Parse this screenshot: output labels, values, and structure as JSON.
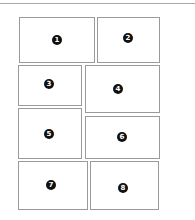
{
  "diagram": {
    "title": "",
    "panels": [
      {
        "label": "1",
        "x": 19,
        "y": 17,
        "w": 76,
        "h": 46,
        "bx": 52,
        "by": 35
      },
      {
        "label": "2",
        "x": 97,
        "y": 17,
        "w": 63,
        "h": 46,
        "bx": 123,
        "by": 33
      },
      {
        "label": "3",
        "x": 18,
        "y": 65,
        "w": 64,
        "h": 41,
        "bx": 44,
        "by": 79
      },
      {
        "label": "4",
        "x": 85,
        "y": 65,
        "w": 75,
        "h": 48,
        "bx": 113,
        "by": 84
      },
      {
        "label": "5",
        "x": 18,
        "y": 108,
        "w": 64,
        "h": 51,
        "bx": 44,
        "by": 129
      },
      {
        "label": "6",
        "x": 85,
        "y": 116,
        "w": 75,
        "h": 43,
        "bx": 117,
        "by": 132
      },
      {
        "label": "7",
        "x": 18,
        "y": 161,
        "w": 70,
        "h": 49,
        "bx": 46,
        "by": 180
      },
      {
        "label": "8",
        "x": 90,
        "y": 161,
        "w": 69,
        "h": 49,
        "bx": 118,
        "by": 183
      }
    ]
  }
}
